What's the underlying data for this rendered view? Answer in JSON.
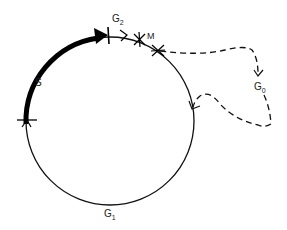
{
  "diagram": {
    "labels": {
      "s": "S",
      "g2_main": "G",
      "g2_sub": "2",
      "m": "M",
      "g0_main": "G",
      "g0_sub": "0",
      "g1_main": "G",
      "g1_sub": "1"
    },
    "colors": {
      "stroke": "#111111",
      "background": "#ffffff"
    }
  }
}
